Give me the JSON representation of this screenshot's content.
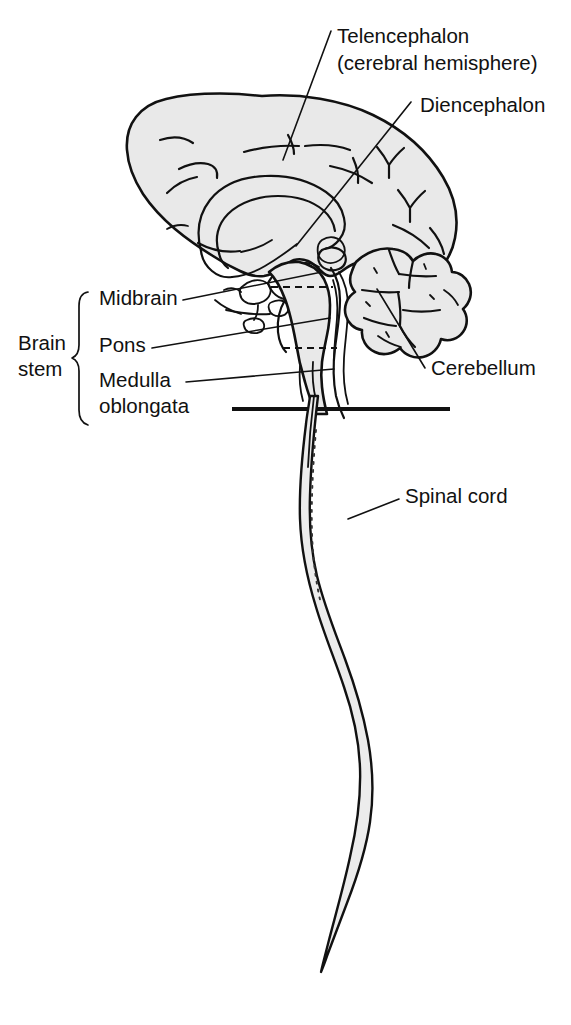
{
  "figure": {
    "fill_color": "#e9e9e9",
    "line_color": "#111111",
    "background_color": "#ffffff"
  },
  "labels": {
    "telencephalon_line1": "Telencephalon",
    "telencephalon_line2": "(cerebral hemisphere)",
    "diencephalon": "Diencephalon",
    "cerebellum": "Cerebellum",
    "spinal_cord": "Spinal cord",
    "midbrain": "Midbrain",
    "pons": "Pons",
    "medulla_line1": "Medulla",
    "medulla_line2": "oblongata",
    "brain_stem_line1": "Brain",
    "brain_stem_line2": "stem"
  },
  "structures": [
    {
      "name": "telencephalon",
      "label": "Telencephalon (cerebral hemisphere)"
    },
    {
      "name": "diencephalon",
      "label": "Diencephalon"
    },
    {
      "name": "midbrain",
      "label": "Midbrain"
    },
    {
      "name": "pons",
      "label": "Pons"
    },
    {
      "name": "medulla-oblongata",
      "label": "Medulla oblongata"
    },
    {
      "name": "cerebellum",
      "label": "Cerebellum"
    },
    {
      "name": "spinal-cord",
      "label": "Spinal cord"
    }
  ],
  "brain_stem_group": {
    "bracket_label": "Brain stem",
    "members": [
      "Midbrain",
      "Pons",
      "Medulla oblongata"
    ]
  }
}
